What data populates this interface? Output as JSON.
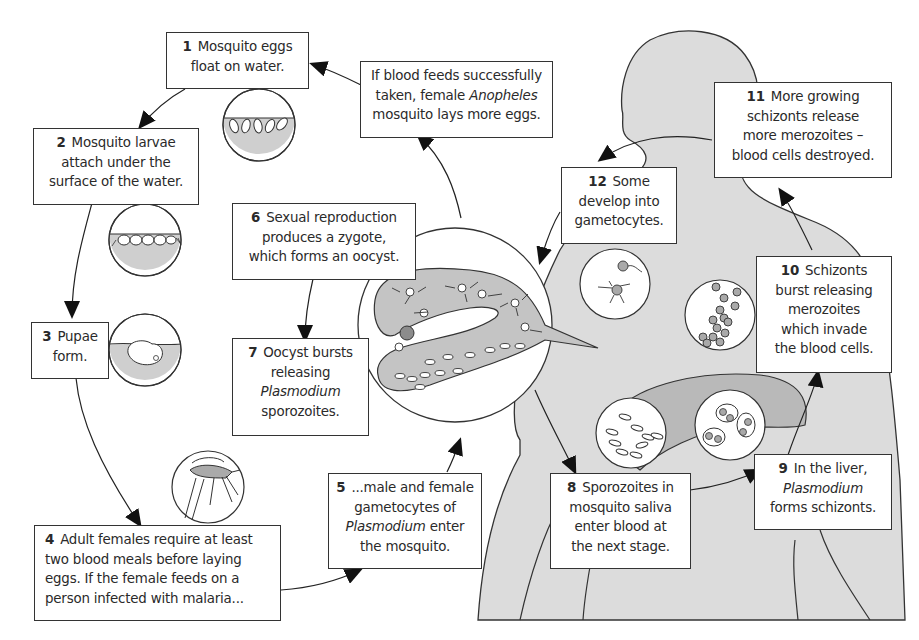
{
  "diagram": {
    "colors": {
      "body_fill": "#dcdcdc",
      "organ_fill": "#b9b9b9",
      "outline": "#333333",
      "water_fill": "#cfcfcf",
      "cell_fill": "#a9a9a9",
      "oocyst_fill": "#8c8c8c"
    },
    "steps": [
      {
        "num": "1",
        "lines": [
          "Mosquito eggs",
          "float on water."
        ]
      },
      {
        "num": "2",
        "lines": [
          "Mosquito larvae",
          "attach under the",
          "surface of the water."
        ]
      },
      {
        "num": "3",
        "lines": [
          "Pupae",
          "form."
        ]
      },
      {
        "num": "4",
        "lines": [
          "Adult females require at least",
          "two blood meals before laying",
          "eggs.  If the female feeds on a",
          "person infected with malaria..."
        ]
      },
      {
        "num": "5",
        "lines": [
          "...male and female",
          "gametocytes of",
          "Plasmodium",
          "enter",
          "the mosquito."
        ]
      },
      {
        "num": "6",
        "lines": [
          "Sexual reproduction",
          "produces a zygote,",
          "which forms an oocyst."
        ]
      },
      {
        "num": "7",
        "lines": [
          "Oocyst bursts",
          "releasing",
          "Plasmodium",
          "sporozoites."
        ]
      },
      {
        "num": "8",
        "lines": [
          "Sporozoites in",
          "mosquito saliva",
          "enter blood at",
          "the next stage."
        ]
      },
      {
        "num": "9",
        "lines": [
          "In the liver,",
          "Plasmodium",
          "forms schizonts."
        ]
      },
      {
        "num": "10",
        "lines": [
          "Schizonts",
          "burst releasing",
          "merozoites",
          "which invade",
          "the blood cells."
        ]
      },
      {
        "num": "11",
        "lines": [
          "More growing",
          "schizonts release",
          "more merozoites –",
          "blood cells destroyed."
        ]
      },
      {
        "num": "12",
        "lines": [
          "Some",
          "develop into",
          "gametocytes."
        ]
      }
    ],
    "feedback": {
      "lines": [
        "If blood feeds successfully",
        "taken, female",
        "Anopheles",
        "mosquito lays more eggs."
      ]
    },
    "illustrations": [
      "eggs-on-water-icon",
      "larvae-under-surface-icon",
      "pupa-in-water-icon",
      "mosquito-feeding-icon",
      "mosquito-stomach-oocyst-icon",
      "gametocytes-in-blood-icon",
      "sporozoites-icon",
      "liver-schizonts-icon",
      "merozoites-icon",
      "human-body-silhouette"
    ]
  }
}
